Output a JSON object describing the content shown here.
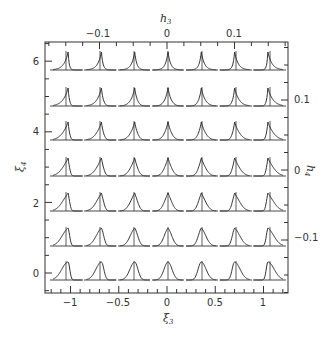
{
  "chart_data": {
    "type": "line",
    "xlabel": "ξ3",
    "ylabel": "ξ4",
    "top_label": "h3",
    "right_label": "h4",
    "xlim": [
      -1.25,
      1.25
    ],
    "ylim": [
      -0.55,
      6.55
    ],
    "x_ticks": [
      "-1",
      "-0.5",
      "0",
      "0.5",
      "1"
    ],
    "x_tick_values": [
      -1,
      -0.5,
      0,
      0.5,
      1
    ],
    "y_ticks": [
      "0",
      "2",
      "4",
      "6"
    ],
    "y_tick_values": [
      0,
      2,
      4,
      6
    ],
    "top_ticks": [
      "-0.1",
      "0",
      "0.1"
    ],
    "top_tick_values": [
      -0.1,
      0,
      0.1
    ],
    "right_ticks": [
      "0.1",
      "0",
      "-0.1"
    ],
    "right_tick_values": [
      0.1,
      0,
      -0.1
    ],
    "grid": false,
    "legend": null,
    "panel_grid": {
      "columns": 7,
      "rows": 7,
      "column_xi3": [
        -1.05,
        -0.7,
        -0.35,
        0,
        0.35,
        0.7,
        1.05
      ],
      "row_xi4": [
        6,
        5,
        4,
        3,
        2,
        1,
        0
      ],
      "shape_notes": "Skewness increases left-to-right (tail shifts from left side to right side); peakedness/kurtosis increases bottom-to-top (flat-topped at bottom, sharp cusp at top)"
    }
  },
  "labels": {
    "x_axis": "ξ",
    "x_axis_sub": "3",
    "y_axis": "ξ",
    "y_axis_sub": "4",
    "top_axis": "h",
    "top_axis_sub": "3",
    "right_axis": "h",
    "right_axis_sub": "4",
    "x_tick_0": "−1",
    "x_tick_1": "−0.5",
    "x_tick_2": "0",
    "x_tick_3": "0.5",
    "x_tick_4": "1",
    "y_tick_0": "0",
    "y_tick_1": "2",
    "y_tick_2": "4",
    "y_tick_3": "6",
    "top_tick_0": "−0.1",
    "top_tick_1": "0",
    "top_tick_2": "0.1",
    "right_tick_0": "0.1",
    "right_tick_1": "0",
    "right_tick_2": "−0.1"
  },
  "colors": {
    "ink": "#333333",
    "background": "#ffffff"
  }
}
